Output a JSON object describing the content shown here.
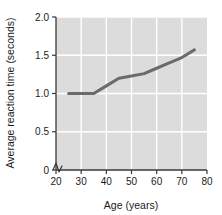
{
  "chart_data": {
    "type": "line",
    "title": "",
    "subtitle": "",
    "xlabel": "Age (years)",
    "ylabel": "Average reaction time (seconds)",
    "xlim": [
      20,
      80
    ],
    "ylim": [
      0,
      2.0
    ],
    "xticks": [
      20,
      30,
      40,
      50,
      60,
      70,
      80
    ],
    "xtick_labels": [
      "20",
      "30",
      "40",
      "50",
      "60",
      "70",
      "80"
    ],
    "yticks": [
      0,
      0.5,
      1.0,
      1.5,
      2.0
    ],
    "ytick_labels": [
      "0",
      "0.5",
      "1.0",
      "1.5",
      "2.0"
    ],
    "grid": true,
    "grid_color": "#ffffff",
    "panel_color": "#dcdcdc",
    "legend": "none",
    "y_axis_break": true,
    "series": [
      {
        "name": "Average reaction time",
        "color": "#6b6b6b",
        "line_width": 3,
        "markers": "none",
        "x": [
          25,
          30,
          35,
          40,
          45,
          50,
          55,
          60,
          65,
          70,
          75
        ],
        "values": [
          1.0,
          1.0,
          1.0,
          1.1,
          1.2,
          1.23,
          1.26,
          1.33,
          1.4,
          1.47,
          1.57
        ]
      }
    ]
  },
  "axes": {
    "x_title": "Age (years)",
    "y_title": "Average reaction time (seconds)",
    "x_ticks": [
      "20",
      "30",
      "40",
      "50",
      "60",
      "70",
      "80"
    ],
    "y_ticks": [
      "2.0",
      "1.5",
      "1.0",
      "0.5",
      "0"
    ]
  },
  "colors": {
    "line": "#6b6b6b",
    "panel": "#dcdcdc",
    "grid": "#ffffff",
    "axis": "#3a3a3a",
    "text": "#1a1a1a",
    "background": "#ffffff"
  }
}
